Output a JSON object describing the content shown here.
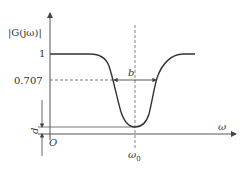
{
  "diagram": {
    "type": "band-stop filter magnitude response",
    "y_axis_label": "|G(jω)|",
    "x_axis_label": "ω",
    "origin_label": "O",
    "y_ticks": [
      {
        "label": "1",
        "value": 1
      },
      {
        "label": "0.707",
        "value": 0.707
      }
    ],
    "center_frequency_label": "ω",
    "center_frequency_subscript": "0",
    "bandwidth_label": "b",
    "depth_label": "d",
    "colors": {
      "curve": "#333333",
      "axes": "#555555",
      "dashed": "#666666"
    }
  }
}
